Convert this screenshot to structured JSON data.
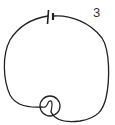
{
  "diagram": {
    "type": "circuit",
    "label": "3",
    "components": [
      {
        "name": "battery",
        "description": "cell with long and short plates"
      },
      {
        "name": "wire",
        "description": "hand-drawn loop connecting battery to bulb"
      },
      {
        "name": "bulb",
        "description": "circle with filament loop"
      }
    ],
    "colors": {
      "stroke": "#222222",
      "background": "#ffffff"
    }
  }
}
